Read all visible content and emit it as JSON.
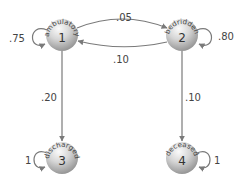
{
  "diagram": {
    "type": "markov-chain-state-diagram",
    "colors": {
      "edge": "#7a7a7a",
      "node_light": "#f2f2f2",
      "node_dark": "#9a9a9a",
      "text": "#444444"
    },
    "nodes": [
      {
        "id": 1,
        "number": "1",
        "name": "ambulatory",
        "cx": 62,
        "cy": 35
      },
      {
        "id": 2,
        "number": "2",
        "name": "bedridden",
        "cx": 182,
        "cy": 35
      },
      {
        "id": 3,
        "number": "3",
        "name": "discharged",
        "cx": 62,
        "cy": 158
      },
      {
        "id": 4,
        "number": "4",
        "name": "deceased",
        "cx": 182,
        "cy": 158
      }
    ],
    "edges": [
      {
        "from": 1,
        "to": 1,
        "label": ".75"
      },
      {
        "from": 1,
        "to": 2,
        "label": ".05"
      },
      {
        "from": 2,
        "to": 1,
        "label": ".10"
      },
      {
        "from": 2,
        "to": 2,
        "label": ".80"
      },
      {
        "from": 1,
        "to": 3,
        "label": ".20"
      },
      {
        "from": 2,
        "to": 4,
        "label": ".10"
      },
      {
        "from": 3,
        "to": 3,
        "label": "1"
      },
      {
        "from": 4,
        "to": 4,
        "label": "1"
      }
    ]
  }
}
